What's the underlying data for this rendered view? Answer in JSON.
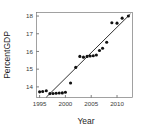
{
  "chart_data": {
    "type": "scatter",
    "title": "",
    "xlabel": "Year",
    "ylabel": "PercentGDP",
    "xlim": [
      1994.4,
      2013.0
    ],
    "ylim": [
      13.4,
      18.2
    ],
    "xticks": [
      1995,
      2000,
      2005,
      2010
    ],
    "yticks": [
      14,
      15,
      16,
      17,
      18
    ],
    "xtick_labels": [
      "1995",
      "2000",
      "2005",
      "2010"
    ],
    "ytick_labels": [
      "14",
      "15",
      "16",
      "17",
      "18"
    ],
    "grid": false,
    "legend": "none",
    "marker": "filled-circle",
    "marker_color": "#111111",
    "line_color": "#1a1a1a",
    "frame_color": "#7a7a7a",
    "x": [
      1995.0,
      1995.6,
      1996.3,
      1997.0,
      1997.6,
      1998.2,
      1998.8,
      1999.4,
      2000.0,
      2001.0,
      2002.0,
      2002.8,
      2003.5,
      2004.2,
      2004.8,
      2005.4,
      2006.0,
      2006.6,
      2007.2,
      2008.0,
      2009.0,
      2010.0,
      2011.0,
      2012.2
    ],
    "y": [
      13.72,
      13.74,
      13.78,
      13.62,
      13.63,
      13.64,
      13.65,
      13.66,
      13.7,
      14.22,
      15.1,
      15.72,
      15.68,
      15.72,
      15.74,
      15.76,
      15.8,
      16.05,
      16.18,
      16.52,
      17.62,
      17.6,
      17.88,
      18.0
    ],
    "fit_line": {
      "x_start": 1996.3,
      "y_start": 13.42,
      "x_end": 2012.6,
      "y_end": 18.12
    },
    "series": [
      {
        "name": "PercentGDP observations",
        "points": [
          {
            "x": 1995.0,
            "y": 13.72
          },
          {
            "x": 1995.6,
            "y": 13.74
          },
          {
            "x": 1996.3,
            "y": 13.78
          },
          {
            "x": 1997.0,
            "y": 13.62
          },
          {
            "x": 1997.6,
            "y": 13.63
          },
          {
            "x": 1998.2,
            "y": 13.64
          },
          {
            "x": 1998.8,
            "y": 13.65
          },
          {
            "x": 1999.4,
            "y": 13.66
          },
          {
            "x": 2000.0,
            "y": 13.7
          },
          {
            "x": 2001.0,
            "y": 14.22
          },
          {
            "x": 2002.0,
            "y": 15.1
          },
          {
            "x": 2002.8,
            "y": 15.72
          },
          {
            "x": 2003.5,
            "y": 15.68
          },
          {
            "x": 2004.2,
            "y": 15.72
          },
          {
            "x": 2004.8,
            "y": 15.74
          },
          {
            "x": 2005.4,
            "y": 15.76
          },
          {
            "x": 2006.0,
            "y": 15.8
          },
          {
            "x": 2006.6,
            "y": 16.05
          },
          {
            "x": 2007.2,
            "y": 16.18
          },
          {
            "x": 2008.0,
            "y": 16.52
          },
          {
            "x": 2009.0,
            "y": 17.62
          },
          {
            "x": 2010.0,
            "y": 17.6
          },
          {
            "x": 2011.0,
            "y": 17.88
          },
          {
            "x": 2012.2,
            "y": 18.0
          }
        ]
      }
    ]
  }
}
